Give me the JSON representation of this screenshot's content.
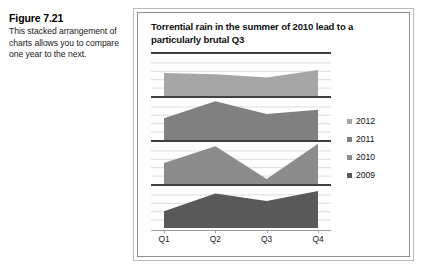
{
  "figure": {
    "number_label": "Figure 7.21",
    "caption": "This stacked arrangement of charts allows you to compare one year to the next."
  },
  "chart_data": {
    "type": "area",
    "panel_layout": "stacked-small-multiples",
    "title": "Torrential rain in the summer of 2010 lead to a particularly brutal Q3",
    "subtitle": "",
    "xlabel": "",
    "ylabel": "",
    "categories": [
      "Q1",
      "Q2",
      "Q3",
      "Q4"
    ],
    "x_tick_labels": [
      "Q1",
      "Q2",
      "Q3",
      "Q4"
    ],
    "grid": true,
    "grid_orientation": "horizontal",
    "legend_position": "right",
    "ylim": [
      0,
      100
    ],
    "series": [
      {
        "name": "2012",
        "color": "#a6a6a6",
        "values": [
          55,
          52,
          44,
          62
        ],
        "panel_index": 0
      },
      {
        "name": "2011",
        "color": "#808080",
        "values": [
          52,
          92,
          62,
          72
        ],
        "panel_index": 1
      },
      {
        "name": "2010",
        "color": "#8c8c8c",
        "values": [
          50,
          90,
          12,
          96
        ],
        "panel_index": 2
      },
      {
        "name": "2009",
        "color": "#595959",
        "values": [
          40,
          82,
          64,
          88
        ],
        "panel_index": 3
      }
    ],
    "legend_entries": [
      "2012",
      "2011",
      "2010",
      "2009"
    ],
    "annotations": []
  },
  "colors": {
    "series_2012": "#a6a6a6",
    "series_2011": "#808080",
    "series_2010": "#8c8c8c",
    "series_2009": "#595959",
    "separator": "#3f3f3f",
    "gridline": "#dcdcdc",
    "axis": "#9a9a9a",
    "frame_outer": "#b9b9b9",
    "frame_inner": "#8e8e8e"
  }
}
